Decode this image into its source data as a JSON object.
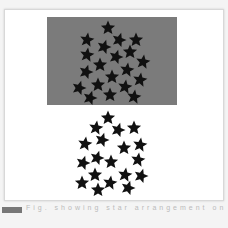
{
  "figure": {
    "top_panel": {
      "background": "#7b7b7b",
      "star_color": "#111111",
      "stars": [
        [
          108,
          28
        ],
        [
          87,
          40
        ],
        [
          119,
          40
        ],
        [
          136,
          40
        ],
        [
          87,
          55
        ],
        [
          104,
          47
        ],
        [
          130,
          52
        ],
        [
          143,
          62
        ],
        [
          116,
          57
        ],
        [
          100,
          65
        ],
        [
          127,
          70
        ],
        [
          86,
          72
        ],
        [
          112,
          77
        ],
        [
          140,
          80
        ],
        [
          79,
          88
        ],
        [
          98,
          85
        ],
        [
          125,
          87
        ],
        [
          90,
          98
        ],
        [
          110,
          95
        ],
        [
          134,
          97
        ]
      ]
    },
    "bottom_panel": {
      "star_color": "#111111",
      "stars": [
        [
          108,
          118
        ],
        [
          96,
          128
        ],
        [
          118,
          130
        ],
        [
          134,
          128
        ],
        [
          85,
          144
        ],
        [
          102,
          140
        ],
        [
          124,
          148
        ],
        [
          140,
          145
        ],
        [
          97,
          158
        ],
        [
          111,
          162
        ],
        [
          138,
          160
        ],
        [
          83,
          163
        ],
        [
          95,
          175
        ],
        [
          125,
          175
        ],
        [
          141,
          176
        ],
        [
          82,
          183
        ],
        [
          110,
          183
        ],
        [
          128,
          188
        ],
        [
          98,
          190
        ]
      ]
    }
  },
  "caption": {
    "text": "Fig. showing star arrangement on and off ..."
  }
}
